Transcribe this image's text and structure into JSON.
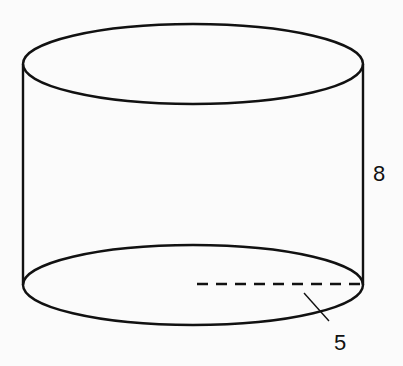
{
  "figure": {
    "shape": "cylinder",
    "labels": {
      "height": "8",
      "radius": "5"
    },
    "colors": {
      "stroke": "#111111",
      "background": "#fbfbfb"
    }
  }
}
